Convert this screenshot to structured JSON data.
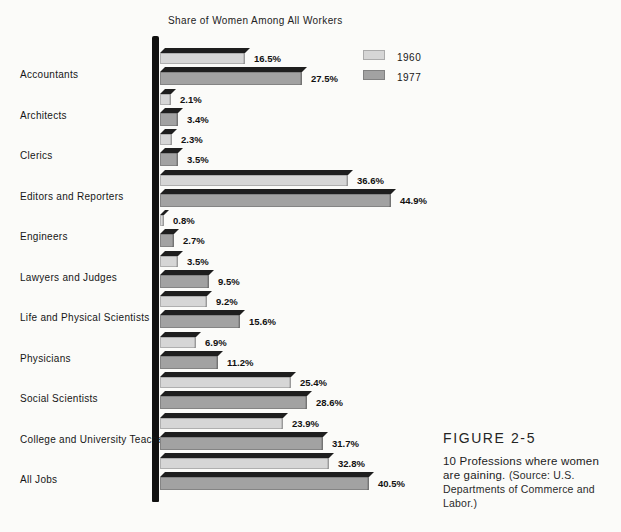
{
  "title": "Share of Women Among All Workers",
  "legend": {
    "entries": [
      "1960",
      "1977"
    ]
  },
  "caption": {
    "figure_label": "FIGURE 2-5",
    "text": "10 Professions where women are gaining. ",
    "source": "(Source: U.S. Departments of Commerce and Labor.)"
  },
  "colors": {
    "bar_1960": "#d6d6d6",
    "bar_1977": "#a2a2a2",
    "bar_top_band": "#1e1e1e",
    "axis": "#101010",
    "background": "#fbfbf9"
  },
  "chart_data": {
    "type": "bar",
    "orientation": "horizontal",
    "title": "Share of Women Among All Workers",
    "value_suffix": "%",
    "xlim": [
      0,
      50
    ],
    "grid": false,
    "legend_position": "top-right",
    "categories": [
      "Accountants",
      "Architects",
      "Clerics",
      "Editors and Reporters",
      "Engineers",
      "Lawyers and Judges",
      "Life and Physical Scientists",
      "Physicians",
      "Social Scientists",
      "College and University Teachers",
      "All Jobs"
    ],
    "series": [
      {
        "name": "1960",
        "values": [
          16.5,
          2.1,
          2.3,
          36.6,
          0.8,
          3.5,
          9.2,
          6.9,
          25.4,
          23.9,
          32.8
        ]
      },
      {
        "name": "1977",
        "values": [
          27.5,
          3.4,
          3.5,
          44.9,
          2.7,
          9.5,
          15.6,
          11.2,
          28.6,
          31.7,
          40.5
        ]
      }
    ]
  }
}
